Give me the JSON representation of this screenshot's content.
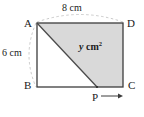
{
  "figure": {
    "kind": "geometry-diagram",
    "shape": "rectangle-with-shaded-quadrilateral",
    "vertices": {
      "top_left": "A",
      "top_right": "D",
      "bottom_left": "B",
      "bottom_right": "C",
      "moving_point": "P"
    },
    "dimensions": {
      "top": "8 cm",
      "left": "6 cm"
    },
    "area_label": {
      "variable": "y",
      "unit": "cm",
      "exponent": "2"
    },
    "colors": {
      "shaded_fill": "#d9d9d9",
      "outline": "#3c3c3c",
      "diagonal": "#4a4a4a",
      "dimension_arc": "#b5b5b5",
      "text": "#1a1a1a",
      "background": "#ffffff"
    },
    "annotations": {
      "arrow_direction": "right",
      "arrow_from": "P",
      "arrow_toward": "C"
    }
  }
}
